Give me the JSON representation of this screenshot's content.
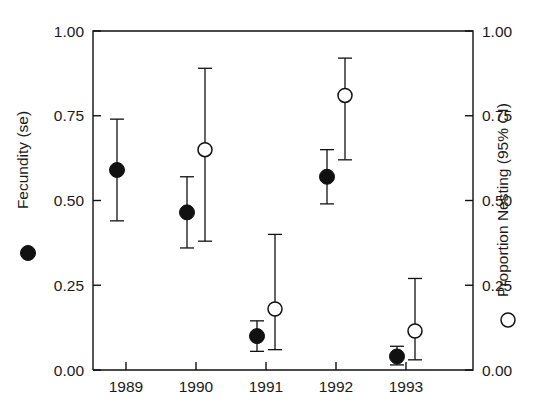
{
  "chart_data": {
    "type": "scatter",
    "title": "",
    "xlabel": "",
    "ylabel": "Fecundity (se)",
    "y2label": "Proportion Nesting (95% CI)",
    "categories": [
      "1989",
      "1990",
      "1991",
      "1992",
      "1993"
    ],
    "x_tick_labels": [
      "1989",
      "1990",
      "1991",
      "1992",
      "1993"
    ],
    "y_tick_labels": [
      "0.00",
      "0.25",
      "0.50",
      "0.75",
      "1.00"
    ],
    "y2_tick_labels": [
      "0.00",
      "0.25",
      "0.50",
      "0.75",
      "1.00"
    ],
    "ylim": [
      0.0,
      1.0
    ],
    "y2lim": [
      0.0,
      1.0
    ],
    "grid": false,
    "legend_position": "axis-labels",
    "series": [
      {
        "name": "Fecundity (se)",
        "marker": "filled-circle",
        "axis": "left",
        "x": [
          "1989",
          "1990",
          "1991",
          "1992",
          "1993"
        ],
        "values": [
          0.59,
          0.465,
          0.1,
          0.57,
          0.04
        ],
        "err_low": [
          0.44,
          0.36,
          0.055,
          0.49,
          0.015
        ],
        "err_high": [
          0.74,
          0.57,
          0.145,
          0.65,
          0.07
        ]
      },
      {
        "name": "Proportion Nesting (95% CI)",
        "marker": "open-circle",
        "axis": "right",
        "x": [
          "1990",
          "1991",
          "1992",
          "1993"
        ],
        "values": [
          0.65,
          0.18,
          0.81,
          0.115
        ],
        "err_low": [
          0.38,
          0.06,
          0.62,
          0.03
        ],
        "err_high": [
          0.89,
          0.4,
          0.92,
          0.27
        ]
      }
    ]
  },
  "legend": {
    "left_marker": "filled-circle",
    "right_marker": "open-circle"
  }
}
